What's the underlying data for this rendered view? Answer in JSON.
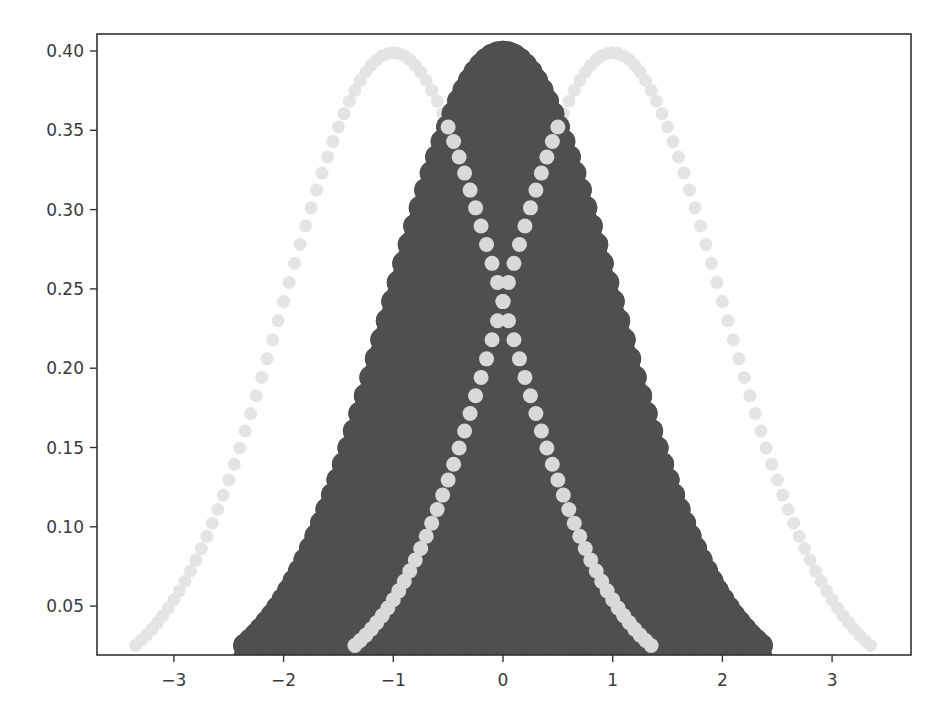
{
  "chart_data": {
    "type": "scatter",
    "title": "",
    "xlabel": "",
    "ylabel": "",
    "xlim": [
      -3.6,
      3.7
    ],
    "ylim": [
      0.0197,
      0.411
    ],
    "grid": false,
    "legend": null,
    "x_ticks": [
      -3,
      -2,
      -1,
      0,
      1,
      2,
      3
    ],
    "x_tick_labels": [
      "−3",
      "−2",
      "−1",
      "0",
      "1",
      "2",
      "3"
    ],
    "y_ticks": [
      0.05,
      0.1,
      0.15,
      0.2,
      0.25,
      0.3,
      0.35,
      0.4
    ],
    "y_tick_labels": [
      "0.05",
      "0.10",
      "0.15",
      "0.20",
      "0.25",
      "0.30",
      "0.35",
      "0.40"
    ],
    "x_step": 0.05,
    "series": [
      {
        "name": "N(0,1) filled",
        "color": "#4f4f4f",
        "marker_size": 24,
        "filled_to_baseline": true,
        "x_start": -2.35,
        "x_end": 2.35,
        "y": [
          0.0252,
          0.0283,
          0.0317,
          0.0355,
          0.0396,
          0.044,
          0.0488,
          0.054,
          0.0596,
          0.0656,
          0.0721,
          0.079,
          0.0863,
          0.094,
          0.1023,
          0.1109,
          0.12,
          0.1295,
          0.1394,
          0.1497,
          0.1604,
          0.1714,
          0.1826,
          0.1942,
          0.2059,
          0.2179,
          0.2299,
          0.242,
          0.2541,
          0.2661,
          0.278,
          0.2897,
          0.3011,
          0.3123,
          0.323,
          0.3332,
          0.3429,
          0.3521,
          0.3605,
          0.3683,
          0.3752,
          0.3814,
          0.3867,
          0.391,
          0.3945,
          0.397,
          0.3984,
          0.3989,
          0.3984,
          0.397,
          0.3945,
          0.391,
          0.3867,
          0.3814,
          0.3752,
          0.3683,
          0.3605,
          0.3521,
          0.3429,
          0.3332,
          0.323,
          0.3123,
          0.3011,
          0.2897,
          0.278,
          0.2661,
          0.2541,
          0.242,
          0.2299,
          0.2179,
          0.2059,
          0.1942,
          0.1826,
          0.1714,
          0.1604,
          0.1497,
          0.1394,
          0.1295,
          0.12,
          0.1109,
          0.1023,
          0.094,
          0.0863,
          0.079,
          0.0721,
          0.0656,
          0.0596,
          0.054,
          0.0488,
          0.044,
          0.0396,
          0.0355,
          0.0317,
          0.0283,
          0.0252
        ]
      },
      {
        "name": "N(-1,1)",
        "color": "#e4e4e4",
        "overlap_color": "#d9d9d9",
        "marker_size": 13,
        "x_start": -3.35,
        "x_end": 1.35,
        "y": "same as series[0].y"
      },
      {
        "name": "N(1,1)",
        "color": "#e4e4e4",
        "overlap_color": "#d9d9d9",
        "marker_size": 13,
        "x_start": -1.35,
        "x_end": 3.35,
        "y": "same as series[0].y"
      }
    ]
  },
  "axes": {
    "frame_color": "#333333",
    "tick_label_color": "#3a3a3a",
    "background": "#ffffff"
  }
}
